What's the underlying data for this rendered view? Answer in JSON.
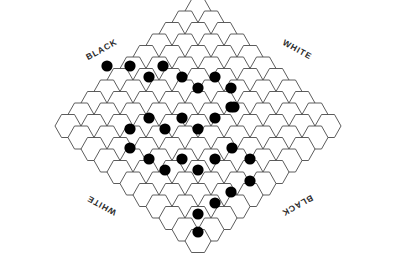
{
  "figure": {
    "kind": "hex-board-diagram",
    "background_color": "#ffffff",
    "line_color": "#4a4a4a",
    "stone_color": "#000000",
    "cell_fill": "#ffffff"
  },
  "edge_labels": [
    {
      "id": "label-top-left",
      "text": "BLACK",
      "x": 103,
      "y": 52,
      "rotate": -29
    },
    {
      "id": "label-top-right",
      "text": "WHITE",
      "x": 296,
      "y": 52,
      "rotate": 29
    },
    {
      "id": "label-bottom-left",
      "text": "WHITE",
      "x": 103,
      "y": 203,
      "rotate": 209
    },
    {
      "id": "label-bottom-right",
      "text": "BLACK",
      "x": 296,
      "y": 203,
      "rotate": 151
    }
  ],
  "geometry": {
    "hex_width": 26,
    "hex_height": 23,
    "col_step": 19.5,
    "row_step": 11.5,
    "origin_x": 198,
    "origin_y": 126,
    "stone_radius": 5.6,
    "rows": 21,
    "shape": "rhombus"
  },
  "board": {
    "description": "Rhombus-shaped hexagonal grid, 11 cells on each side diagonal",
    "rows": [
      {
        "r": -10,
        "count": 1,
        "start": 0
      },
      {
        "r": -9,
        "count": 2,
        "start": -1
      },
      {
        "r": -8,
        "count": 3,
        "start": -2
      },
      {
        "r": -7,
        "count": 4,
        "start": -3
      },
      {
        "r": -6,
        "count": 5,
        "start": -4
      },
      {
        "r": -5,
        "count": 6,
        "start": -5
      },
      {
        "r": -4,
        "count": 7,
        "start": -6
      },
      {
        "r": -3,
        "count": 8,
        "start": -7
      },
      {
        "r": -2,
        "count": 9,
        "start": -8
      },
      {
        "r": -1,
        "count": 10,
        "start": -9
      },
      {
        "r": 0,
        "count": 11,
        "start": -10
      },
      {
        "r": 1,
        "count": 10,
        "start": -9
      },
      {
        "r": 2,
        "count": 9,
        "start": -8
      },
      {
        "r": 3,
        "count": 8,
        "start": -7
      },
      {
        "r": 4,
        "count": 7,
        "start": -6
      },
      {
        "r": 5,
        "count": 6,
        "start": -5
      },
      {
        "r": 6,
        "count": 5,
        "start": -4
      },
      {
        "r": 7,
        "count": 4,
        "start": -3
      },
      {
        "r": 8,
        "count": 3,
        "start": -2
      },
      {
        "r": 9,
        "count": 2,
        "start": -1
      },
      {
        "r": 10,
        "count": 1,
        "start": 0
      }
    ]
  },
  "stones": {
    "color": "black",
    "count": 29,
    "positions": [
      {
        "x": 130,
        "y": 66
      },
      {
        "x": 163,
        "y": 66
      },
      {
        "x": 149,
        "y": 77
      },
      {
        "x": 182,
        "y": 77
      },
      {
        "x": 215,
        "y": 77
      },
      {
        "x": 198,
        "y": 88
      },
      {
        "x": 231,
        "y": 88
      },
      {
        "x": 234,
        "y": 107
      },
      {
        "x": 149,
        "y": 118
      },
      {
        "x": 182,
        "y": 118
      },
      {
        "x": 215,
        "y": 118
      },
      {
        "x": 130,
        "y": 129
      },
      {
        "x": 165,
        "y": 129
      },
      {
        "x": 198,
        "y": 129
      },
      {
        "x": 130,
        "y": 148
      },
      {
        "x": 232,
        "y": 148
      },
      {
        "x": 149,
        "y": 159
      },
      {
        "x": 182,
        "y": 159
      },
      {
        "x": 215,
        "y": 159
      },
      {
        "x": 250,
        "y": 159
      },
      {
        "x": 165,
        "y": 170
      },
      {
        "x": 198,
        "y": 170
      },
      {
        "x": 250,
        "y": 181
      },
      {
        "x": 231,
        "y": 192
      },
      {
        "x": 215,
        "y": 203
      },
      {
        "x": 198,
        "y": 214
      },
      {
        "x": 198,
        "y": 232
      },
      {
        "x": 231,
        "y": 107
      },
      {
        "x": 107,
        "y": 66
      }
    ]
  }
}
